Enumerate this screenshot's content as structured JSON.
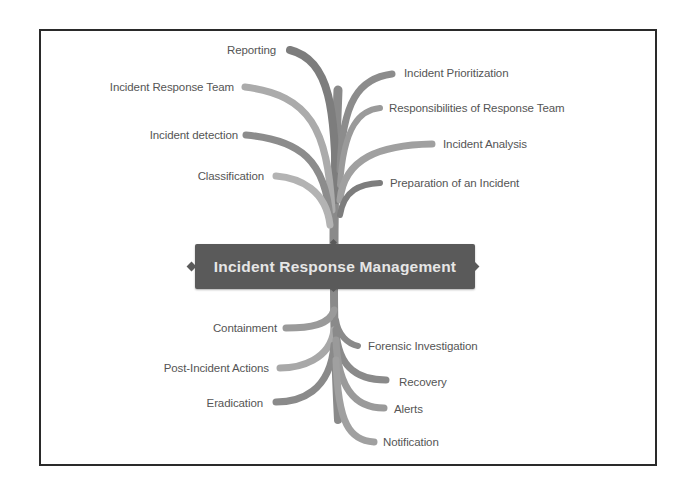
{
  "diagram": {
    "type": "mind-map",
    "central_topic": "Incident Response Management",
    "colors": {
      "frame_border": "#2a2a2a",
      "central_node_bg": "#5a5a5a",
      "central_node_text": "#e6e6e6",
      "branch_dark": "#7a7a7a",
      "branch_light": "#a8a8a8",
      "label_text": "#555555"
    },
    "top_left_branches": [
      {
        "label": "Reporting"
      },
      {
        "label": "Incident Response Team"
      },
      {
        "label": "Incident detection"
      },
      {
        "label": "Classification"
      }
    ],
    "top_right_branches": [
      {
        "label": "Incident Prioritization"
      },
      {
        "label": "Responsibilities of Response Team"
      },
      {
        "label": "Incident Analysis"
      },
      {
        "label": "Preparation of an Incident"
      }
    ],
    "bottom_left_branches": [
      {
        "label": "Containment"
      },
      {
        "label": "Post-Incident Actions"
      },
      {
        "label": "Eradication"
      }
    ],
    "bottom_right_branches": [
      {
        "label": "Forensic Investigation"
      },
      {
        "label": "Recovery"
      },
      {
        "label": "Alerts"
      },
      {
        "label": "Notification"
      }
    ]
  }
}
